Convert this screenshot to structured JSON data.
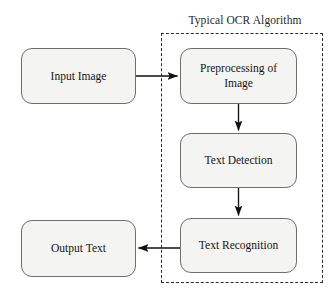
{
  "diagram": {
    "type": "flowchart",
    "orientation": "mixed",
    "background_color": "#ffffff",
    "node_fill_color": "#f4f4f2",
    "node_border_color": "#6e6e6e",
    "arrow_color": "#111111",
    "group_border_color": "#2b2b2b",
    "group": {
      "title": "Typical OCR Algorithm",
      "border_style": "dashed",
      "contains": [
        "Preprocessing of Image",
        "Text Detection",
        "Text Recognition"
      ]
    },
    "nodes": [
      {
        "id": "input-image",
        "label": "Input Image",
        "shape": "rounded-rectangle",
        "in_group": false
      },
      {
        "id": "preprocessing",
        "label": "Preprocessing of\nImage",
        "shape": "rounded-rectangle",
        "in_group": true
      },
      {
        "id": "text-detection",
        "label": "Text Detection",
        "shape": "rounded-rectangle",
        "in_group": true
      },
      {
        "id": "text-recognition",
        "label": "Text Recognition",
        "shape": "rounded-rectangle",
        "in_group": true
      },
      {
        "id": "output-text",
        "label": "Output  Text",
        "shape": "rounded-rectangle",
        "in_group": false
      }
    ],
    "edges": [
      {
        "id": "edge-input-to-preprocessing",
        "from": "input-image",
        "to": "preprocessing",
        "direction": "right",
        "label": ""
      },
      {
        "id": "edge-preprocessing-to-detection",
        "from": "preprocessing",
        "to": "text-detection",
        "direction": "down",
        "label": ""
      },
      {
        "id": "edge-detection-to-recognition",
        "from": "text-detection",
        "to": "text-recognition",
        "direction": "down",
        "label": ""
      },
      {
        "id": "edge-recognition-to-output",
        "from": "text-recognition",
        "to": "output-text",
        "direction": "left",
        "label": ""
      }
    ]
  }
}
